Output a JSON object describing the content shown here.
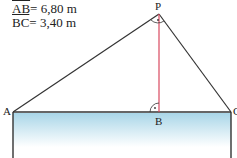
{
  "given": [
    {
      "segment": "AB",
      "eq": "= 6,80 m"
    },
    {
      "segment": "BC",
      "eq": "= 3,40 m"
    }
  ],
  "points": {
    "A": "A",
    "B": "B",
    "C": "C",
    "P": "P"
  },
  "colors": {
    "line": "#333333",
    "height_line": "#d9485f",
    "water_top": "#a9d6e8",
    "water_bottom": "#ffffff"
  }
}
